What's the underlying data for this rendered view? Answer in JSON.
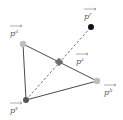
{
  "diagram": {
    "points": {
      "a": {
        "label": "p",
        "sup": "a",
        "x": 23,
        "y": 44,
        "color": "#bdbdbd"
      },
      "b": {
        "label": "p",
        "sup": "b",
        "x": 97,
        "y": 81,
        "color": "#bdbdbd"
      },
      "s": {
        "label": "p",
        "sup": "s",
        "x": 26,
        "y": 100,
        "color": "#555555"
      },
      "z": {
        "label": "p",
        "sup": "z",
        "x": 59,
        "y": 62,
        "color": "#6e6e6e"
      },
      "r": {
        "label": "p",
        "sup": "r",
        "x": 91,
        "y": 27,
        "color": "#111111"
      }
    },
    "edges": [
      {
        "from": "a",
        "to": "b",
        "style": "solid"
      },
      {
        "from": "a",
        "to": "s",
        "style": "solid"
      },
      {
        "from": "s",
        "to": "b",
        "style": "solid"
      },
      {
        "from": "s",
        "to": "r",
        "style": "dashed"
      }
    ],
    "colors": {
      "edge": "#4a4a4a",
      "label": "#555555"
    }
  }
}
